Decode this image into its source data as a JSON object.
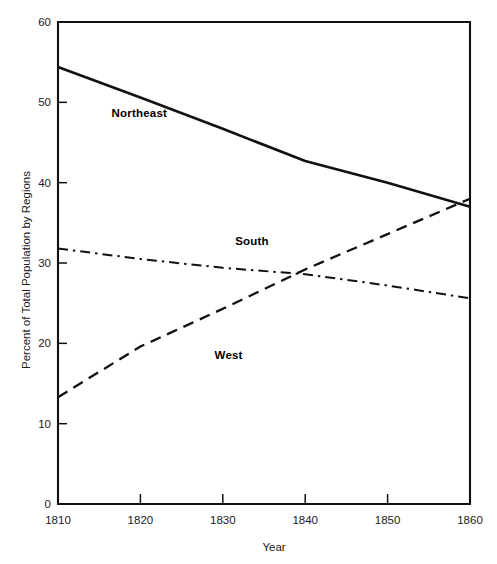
{
  "chart_data": {
    "type": "line",
    "title": "",
    "xlabel": "Year",
    "ylabel": "Percent of Total Population by Regions",
    "xlim": [
      1810,
      1860
    ],
    "ylim": [
      0,
      60
    ],
    "xticks": [
      1810,
      1820,
      1830,
      1840,
      1850,
      1860
    ],
    "yticks": [
      0,
      10,
      20,
      30,
      40,
      50,
      60
    ],
    "xtick_labels": [
      "1810",
      "1820",
      "1830",
      "1840",
      "1850",
      "1860"
    ],
    "ytick_labels": [
      "0",
      "10",
      "20",
      "30",
      "40",
      "50",
      "60"
    ],
    "grid": false,
    "legend_position": "inline-annotations",
    "x": [
      1810,
      1820,
      1830,
      1840,
      1850,
      1860
    ],
    "series": [
      {
        "name": "Northeast",
        "style": "solid",
        "stroke_width": 2.6,
        "label_x": 1816.5,
        "label_y": 48.2,
        "values": [
          54.4,
          50.6,
          46.7,
          42.7,
          40.0,
          37.0
        ]
      },
      {
        "name": "South",
        "style": "dash-dot",
        "stroke_width": 2.0,
        "label_x": 1831.5,
        "label_y": 32.3,
        "values": [
          31.8,
          30.5,
          29.4,
          28.6,
          27.2,
          25.6
        ]
      },
      {
        "name": "West",
        "style": "dashed",
        "stroke_width": 2.3,
        "label_x": 1829.0,
        "label_y": 18.0,
        "values": [
          13.3,
          19.6,
          24.3,
          29.2,
          33.6,
          38.0
        ]
      }
    ]
  },
  "axes": {
    "x_title": "Year",
    "y_title": "Percent of Total Population by Regions"
  }
}
